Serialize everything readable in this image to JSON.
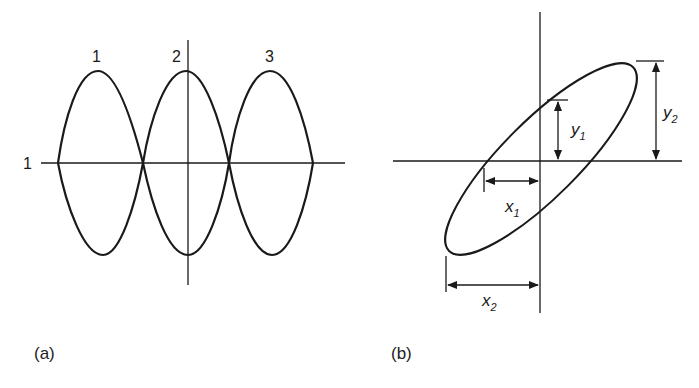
{
  "panel_a": {
    "caption": "(a)",
    "lobe_labels": [
      "1",
      "2",
      "3"
    ],
    "axis_label": "1"
  },
  "panel_b": {
    "caption": "(b)",
    "dimensions": {
      "y1": {
        "base": "y",
        "sub": "1"
      },
      "y2": {
        "base": "y",
        "sub": "2"
      },
      "x1": {
        "base": "x",
        "sub": "1"
      },
      "x2": {
        "base": "x",
        "sub": "2"
      }
    }
  },
  "colors": {
    "stroke": "#1a1a1a",
    "background": "#ffffff"
  }
}
